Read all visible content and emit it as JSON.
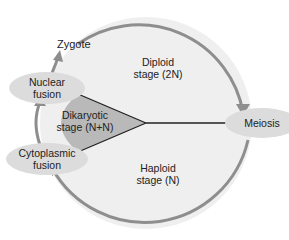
{
  "diagram": {
    "type": "life-cycle",
    "stages": [
      {
        "id": "diploid",
        "line1": "Diploid",
        "line2": "stage (2N)"
      },
      {
        "id": "dikaryotic",
        "line1": "Dikaryotic",
        "line2": "stage (N+N)"
      },
      {
        "id": "haploid",
        "line1": "Haploid",
        "line2": "stage (N)"
      }
    ],
    "events": [
      {
        "id": "nuclear-fusion",
        "line1": "Nuclear",
        "line2": "fusion"
      },
      {
        "id": "meiosis",
        "line1": "Meiosis"
      },
      {
        "id": "cytoplasmic-fusion",
        "line1": "Cytoplasmic",
        "line2": "fusion"
      }
    ],
    "outputs": [
      {
        "id": "zygote",
        "label": "Zygote"
      }
    ],
    "colors": {
      "circle_fill": "#efefef",
      "circle_stroke": "#8a8a8a",
      "dikaryotic_fill": "#b9b9b9",
      "ellipse_fill": "#dcdcdc",
      "arrow": "#8e8e8e",
      "divider": "#222222"
    }
  }
}
